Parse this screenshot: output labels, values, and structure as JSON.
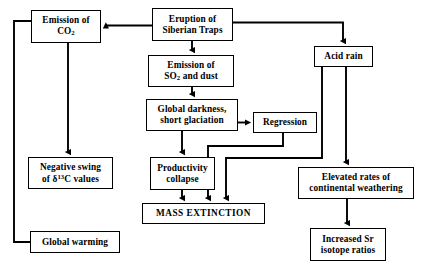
{
  "diagram": {
    "background_color": "#ffffff",
    "line_color": "#000000",
    "nodes": [
      {
        "id": "emission_co2",
        "label": "Emission of\nCO2",
        "label_plain": "Emission of CO2",
        "has_subscript": true,
        "x": 31,
        "y": 10,
        "w": 70,
        "h": 33
      },
      {
        "id": "eruption",
        "label": "Eruption of\nSiberian Traps",
        "x": 152,
        "y": 8,
        "w": 81,
        "h": 33
      },
      {
        "id": "emission_so2",
        "label": "Emission of\nSO2 and dust",
        "label_plain": "Emission of SO2 and dust",
        "has_subscript": true,
        "x": 148,
        "y": 55,
        "w": 86,
        "h": 32
      },
      {
        "id": "acid_rain",
        "label": "Acid rain",
        "x": 314,
        "y": 46,
        "w": 59,
        "h": 21
      },
      {
        "id": "global_darkness",
        "label": "Global darkness,\nshort glaciation",
        "x": 146,
        "y": 99,
        "w": 92,
        "h": 32
      },
      {
        "id": "regression",
        "label": "Regression",
        "x": 253,
        "y": 112,
        "w": 64,
        "h": 21
      },
      {
        "id": "negative_swing",
        "label": "Negative swing\nof δ13C values",
        "label_plain": "Negative swing of δ13C values",
        "has_superscript": true,
        "x": 28,
        "y": 157,
        "w": 85,
        "h": 32
      },
      {
        "id": "productivity_collapse",
        "label": "Productivity\ncollapse",
        "x": 150,
        "y": 157,
        "w": 65,
        "h": 33
      },
      {
        "id": "elevated_rates",
        "label": "Elevated rates of\ncontinental weathering",
        "x": 298,
        "y": 167,
        "w": 116,
        "h": 32
      },
      {
        "id": "mass_extinction",
        "label": "MASS EXTINCTION",
        "x": 142,
        "y": 203,
        "w": 123,
        "h": 21
      },
      {
        "id": "global_warming",
        "label": "Global warming",
        "x": 30,
        "y": 231,
        "w": 90,
        "h": 22
      },
      {
        "id": "increased_sr",
        "label": "Increased Sr\nisotope ratios",
        "x": 310,
        "y": 228,
        "w": 76,
        "h": 33
      }
    ],
    "edges": [
      {
        "id": "eruption-to-emission_co2",
        "from": "eruption",
        "to": "emission_co2",
        "style": "horizontal-left-arrow"
      },
      {
        "id": "eruption-to-acid_rain",
        "from": "eruption",
        "to": "acid_rain",
        "style": "right-then-down"
      },
      {
        "id": "eruption-to-emission_so2",
        "from": "eruption",
        "to": "emission_so2",
        "style": "vertical-down"
      },
      {
        "id": "emission_so2-to-global_darkness",
        "from": "emission_so2",
        "to": "global_darkness",
        "style": "vertical-down"
      },
      {
        "id": "global_darkness-to-regression",
        "from": "global_darkness",
        "to": "regression",
        "style": "horizontal-right-arrow"
      },
      {
        "id": "global_darkness-to-productivity_collapse",
        "from": "global_darkness",
        "to": "productivity_collapse",
        "style": "vertical-down"
      },
      {
        "id": "productivity_collapse-to-mass_extinction",
        "from": "productivity_collapse",
        "to": "mass_extinction",
        "style": "vertical-down"
      },
      {
        "id": "regression-to-mass_extinction",
        "from": "regression",
        "to": "mass_extinction",
        "style": "down-left-down"
      },
      {
        "id": "acid_rain-to-mass_extinction",
        "from": "acid_rain",
        "to": "mass_extinction",
        "style": "down-left-down"
      },
      {
        "id": "emission_co2-to-negative_swing",
        "from": "emission_co2",
        "to": "negative_swing",
        "style": "vertical-down"
      },
      {
        "id": "emission_co2-to-global_warming",
        "from": "emission_co2",
        "to": "global_warming",
        "style": "left-down-right"
      },
      {
        "id": "acid_rain-to-elevated_rates",
        "from": "acid_rain",
        "to": "elevated_rates",
        "style": "vertical-down"
      },
      {
        "id": "elevated_rates-to-increased_sr",
        "from": "elevated_rates",
        "to": "increased_sr",
        "style": "vertical-down"
      }
    ]
  }
}
